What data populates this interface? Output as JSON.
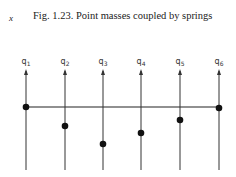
{
  "figure": {
    "axis_symbol": "x",
    "caption": "Fig. 1.23. Point masses coupled by springs",
    "coordinates": [
      {
        "label": "q1",
        "x": 26,
        "mass_y": 107
      },
      {
        "label": "q2",
        "x": 65,
        "mass_y": 126
      },
      {
        "label": "q3",
        "x": 103,
        "mass_y": 144
      },
      {
        "label": "q4",
        "x": 141,
        "mass_y": 133
      },
      {
        "label": "q5",
        "x": 180,
        "mass_y": 120
      },
      {
        "label": "q6",
        "x": 219,
        "mass_y": 108
      }
    ]
  }
}
